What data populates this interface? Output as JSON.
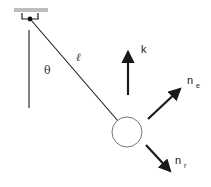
{
  "diagram": {
    "title": "",
    "labels": {
      "theta": "θ",
      "length": "ℓ",
      "k": "k",
      "n_e": "n",
      "n_e_sub": "e",
      "n_r": "n",
      "n_r_sub": "r"
    },
    "colors": {
      "stroke": "#1a1a1a",
      "ceiling": "#bdbdbd",
      "circle": "#777777"
    },
    "elements": [
      {
        "type": "ceiling-mount",
        "x": 30,
        "y": 19
      },
      {
        "type": "vertical-reference-line"
      },
      {
        "type": "pendulum-string",
        "label": "ℓ"
      },
      {
        "type": "angle",
        "label": "θ"
      },
      {
        "type": "bob-circle"
      },
      {
        "type": "vector",
        "label": "k",
        "direction": "up"
      },
      {
        "type": "vector",
        "label": "n_e",
        "direction": "up-right"
      },
      {
        "type": "vector",
        "label": "n_r",
        "direction": "down-right"
      }
    ]
  }
}
